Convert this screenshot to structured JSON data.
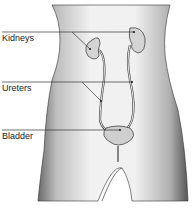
{
  "diagram": {
    "labels": [
      {
        "text": "Kidneys",
        "y": 33
      },
      {
        "text": "Ureters",
        "y": 83
      },
      {
        "text": "Bladder",
        "y": 131
      }
    ]
  }
}
